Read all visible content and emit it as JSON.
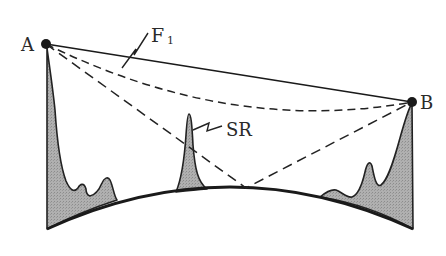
{
  "diagram": {
    "type": "radio propagation path diagram",
    "points": {
      "A": {
        "label": "A",
        "x": 46,
        "y": 44
      },
      "B": {
        "label": "B",
        "x": 412,
        "y": 102
      }
    },
    "labels": {
      "first_fresnel": "F",
      "first_fresnel_sub": "1",
      "scatter_reflection": "SR",
      "point_a": "A",
      "point_b": "B"
    },
    "paths": [
      {
        "name": "direct-path",
        "style": "solid",
        "from": "A",
        "to": "B"
      },
      {
        "name": "fresnel-zone-boundary",
        "style": "dashed",
        "from": "A",
        "to": "B",
        "shape": "curved"
      },
      {
        "name": "ground-reflected-path",
        "style": "dashed",
        "from": "A",
        "via": [
          246,
          188
        ],
        "to": "B"
      }
    ],
    "terrain": {
      "fill_color": "#a9a9a9",
      "stroke_color": "#222222",
      "features": [
        "left-hill-mast",
        "central-spike",
        "right-hill-mast"
      ]
    },
    "colors": {
      "ink": "#222222",
      "terrain_fill": "#a9a9a9",
      "background": "#ffffff"
    }
  }
}
